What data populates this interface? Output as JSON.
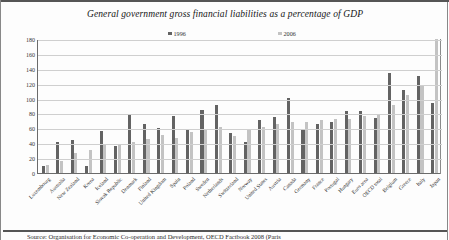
{
  "figure": {
    "title": "General government gross financial liabilities as a percentage of GDP",
    "source_note": "Source: Organisation for Economic Co-operation and Development, OECD Factbook 2008 (Paris"
  },
  "chart_data": {
    "type": "bar",
    "title": "General government gross financial liabilities as a percentage of GDP",
    "xlabel": "",
    "ylabel": "",
    "ylim": [
      0,
      180
    ],
    "yticks": [
      0,
      20,
      40,
      60,
      80,
      100,
      120,
      140,
      160,
      180
    ],
    "grid": true,
    "legend_position": "top",
    "colors": {
      "1996": "#636363",
      "2006": "#c3c3c3"
    },
    "categories": [
      "Luxembourg",
      "Australia",
      "New Zealand",
      "Korea",
      "Iceland",
      "Slovak Republic",
      "Denmark",
      "Finland",
      "United Kingdom",
      "Spain",
      "Poland",
      "Sweden",
      "Netherlands",
      "Switzerland",
      "Norway",
      "United States",
      "Austria",
      "Canada",
      "Germany",
      "France",
      "Portugal",
      "Hungary",
      "Euro area",
      "OECD total",
      "Belgium",
      "Greece",
      "Italy",
      "Japan"
    ],
    "series": [
      {
        "name": "1996",
        "values": [
          9,
          41,
          44,
          10,
          56,
          36,
          79,
          66,
          60,
          76,
          58,
          84,
          92,
          54,
          41,
          71,
          75,
          101,
          58,
          66,
          68,
          83,
          83,
          74,
          135,
          111,
          130,
          94
        ]
      },
      {
        "name": "2006",
        "values": [
          11,
          16,
          27,
          31,
          39,
          38,
          41,
          46,
          51,
          47,
          55,
          58,
          62,
          50,
          59,
          62,
          66,
          68,
          69,
          71,
          72,
          73,
          77,
          79,
          91,
          105,
          117,
          180
        ]
      }
    ]
  }
}
